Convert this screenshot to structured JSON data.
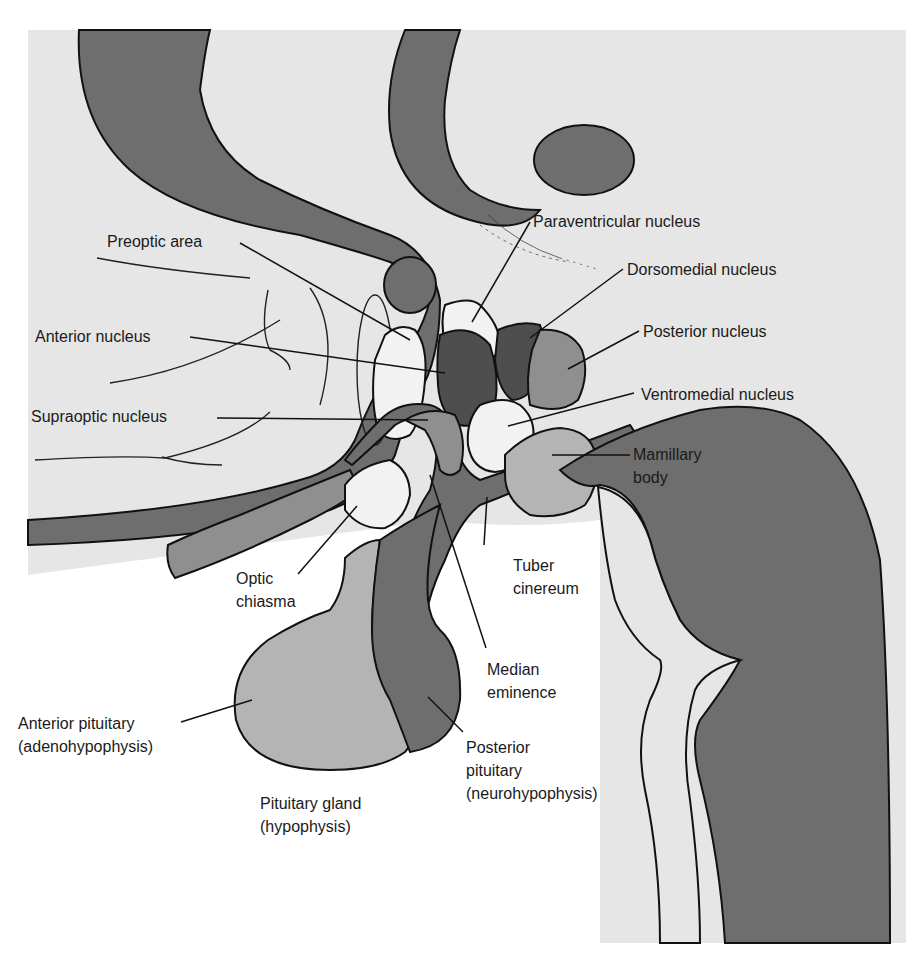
{
  "diagram": {
    "colors": {
      "background_panel": "#e6e6e6",
      "page": "#ffffff",
      "dark_gray": "#6e6e6e",
      "mid_gray": "#8f8f8f",
      "light_gray": "#b4b4b4",
      "darkest_gray": "#4e4e4e",
      "white_region": "#f2f2f2",
      "outline": "#111111"
    },
    "labels": {
      "preoptic_area": "Preoptic area",
      "anterior_nucleus": "Anterior nucleus",
      "supraoptic_nucleus": "Supraoptic nucleus",
      "paraventricular_nucleus": "Paraventricular nucleus",
      "dorsomedial_nucleus": "Dorsomedial nucleus",
      "posterior_nucleus": "Posterior nucleus",
      "ventromedial_nucleus": "Ventromedial nucleus",
      "mamillary_body": "Mamillary\nbody",
      "optic_chiasma": "Optic\nchiasma",
      "tuber_cinereum": "Tuber\ncinereum",
      "median_eminence": "Median\neminence",
      "anterior_pituitary": "Anterior pituitary\n(adenohypophysis)",
      "posterior_pituitary": "Posterior\npituitary\n(neurohypophysis)",
      "pituitary_gland": "Pituitary gland\n(hypophysis)"
    }
  }
}
